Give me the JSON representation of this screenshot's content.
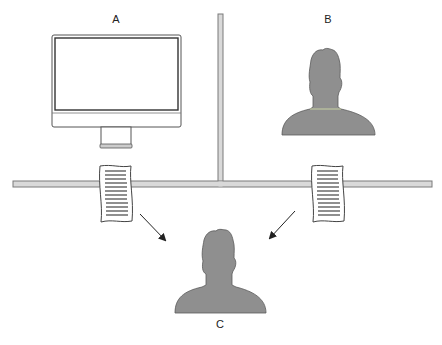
{
  "diagram": {
    "labels": {
      "a": "A",
      "b": "B",
      "c": "C"
    },
    "colors": {
      "background": "#ffffff",
      "pipe_fill": "#d9d9d9",
      "pipe_stroke": "#7a7a7a",
      "person_fill": "#8f8f8f",
      "person_stroke": "#5a5a5a",
      "monitor_stroke": "#555555",
      "document_stroke": "#444444",
      "arrow": "#222222"
    },
    "nodes": [
      {
        "id": "A",
        "kind": "computer-monitor"
      },
      {
        "id": "B",
        "kind": "person"
      },
      {
        "id": "C",
        "kind": "person"
      }
    ],
    "messages": [
      {
        "kind": "document",
        "position": "left-channel",
        "direction": "to-C"
      },
      {
        "kind": "document",
        "position": "right-channel",
        "direction": "to-C"
      }
    ]
  }
}
